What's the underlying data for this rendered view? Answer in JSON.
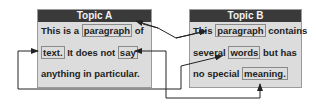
{
  "topic_a": {
    "title": "Topic A",
    "lines": [
      {
        "pre": "This is a ",
        "word": "paragraph",
        "post": " of"
      },
      {
        "word1": "text.",
        "mid": " It does not ",
        "word2": "say"
      },
      {
        "text": "anything in particular."
      }
    ]
  },
  "topic_b": {
    "title": "Topic B",
    "lines": [
      {
        "pre": "This ",
        "word": "paragraph",
        "post": " contains"
      },
      {
        "pre": "several ",
        "word": "words",
        "post": " but has"
      },
      {
        "pre": "no special ",
        "word": "meaning."
      }
    ]
  },
  "links": [
    {
      "from": "A:paragraph",
      "to": "B:paragraph"
    },
    {
      "from": "B:meaning.",
      "to": "A:say"
    },
    {
      "from": "A:text.",
      "to": "B:words"
    }
  ],
  "colors": {
    "header_bg": "#3a3a3a",
    "box_bg": "#dcdcdc",
    "line": "#222222"
  }
}
